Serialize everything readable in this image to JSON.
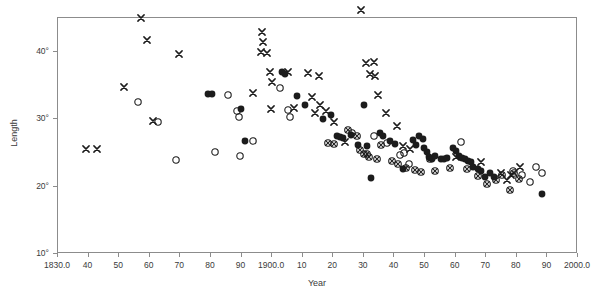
{
  "chart_data": {
    "type": "scatter",
    "title": "",
    "xlabel": "Year",
    "ylabel": "Length",
    "xlim": [
      1830.0,
      2000.0
    ],
    "ylim": [
      10,
      45
    ],
    "grid": false,
    "legend": "none",
    "x_ticks": [
      {
        "value": 1830,
        "label": "1830.0"
      },
      {
        "value": 1840,
        "label": "40"
      },
      {
        "value": 1850,
        "label": "50"
      },
      {
        "value": 1860,
        "label": "60"
      },
      {
        "value": 1870,
        "label": "70"
      },
      {
        "value": 1880,
        "label": "80"
      },
      {
        "value": 1890,
        "label": "90"
      },
      {
        "value": 1900,
        "label": "1900.0"
      },
      {
        "value": 1910,
        "label": "10"
      },
      {
        "value": 1920,
        "label": "20"
      },
      {
        "value": 1930,
        "label": "30"
      },
      {
        "value": 1940,
        "label": "40"
      },
      {
        "value": 1950,
        "label": "50"
      },
      {
        "value": 1960,
        "label": "60"
      },
      {
        "value": 1970,
        "label": "70"
      },
      {
        "value": 1980,
        "label": "80"
      },
      {
        "value": 1990,
        "label": "90"
      },
      {
        "value": 2000,
        "label": "2000.0"
      }
    ],
    "y_ticks": [
      {
        "value": 10,
        "label": "10°"
      },
      {
        "value": 20,
        "label": "20°"
      },
      {
        "value": 30,
        "label": "30°"
      },
      {
        "value": 40,
        "label": "40°"
      }
    ],
    "marker_types": [
      "cross",
      "open-circle",
      "filled-circle",
      "crossed-circle"
    ],
    "series": [
      {
        "name": "cross",
        "marker": "cross",
        "points": [
          [
            1839.5,
            25.4
          ],
          [
            1843.0,
            25.4
          ],
          [
            1852.0,
            34.6
          ],
          [
            1857.5,
            44.9
          ],
          [
            1859.5,
            41.6
          ],
          [
            1861.5,
            29.6
          ],
          [
            1870.0,
            39.5
          ],
          [
            1894.0,
            33.8
          ],
          [
            1897.0,
            42.8
          ],
          [
            1897.5,
            41.3
          ],
          [
            1896.8,
            39.8
          ],
          [
            1898.6,
            39.7
          ],
          [
            1899.5,
            36.9
          ],
          [
            1900.2,
            35.3
          ],
          [
            1900.0,
            31.3
          ],
          [
            1905.5,
            36.9
          ],
          [
            1907.5,
            31.5
          ],
          [
            1912.0,
            36.7
          ],
          [
            1913.5,
            33.2
          ],
          [
            1914.5,
            30.8
          ],
          [
            1915.5,
            36.3
          ],
          [
            1916.0,
            32.0
          ],
          [
            1918.0,
            31.1
          ],
          [
            1920.5,
            29.5
          ],
          [
            1924.0,
            26.4
          ],
          [
            1929.5,
            46.1
          ],
          [
            1931.0,
            38.2
          ],
          [
            1932.3,
            36.5
          ],
          [
            1933.5,
            38.4
          ],
          [
            1933.8,
            36.3
          ],
          [
            1935.0,
            33.5
          ],
          [
            1937.5,
            30.8
          ],
          [
            1941.0,
            28.8
          ],
          [
            1943.0,
            25.9
          ],
          [
            1945.5,
            25.4
          ],
          [
            1960.5,
            24.2
          ],
          [
            1968.5,
            23.5
          ],
          [
            1975.0,
            21.9
          ],
          [
            1977.0,
            20.8
          ],
          [
            1978.5,
            21.5
          ],
          [
            1981.5,
            22.8
          ]
        ]
      },
      {
        "name": "open-circle",
        "marker": "open-circle",
        "points": [
          [
            1856.5,
            32.4
          ],
          [
            1863.0,
            29.5
          ],
          [
            1869.0,
            23.8
          ],
          [
            1881.5,
            25.0
          ],
          [
            1886.0,
            33.5
          ],
          [
            1889.0,
            31.0
          ],
          [
            1889.5,
            30.1
          ],
          [
            1889.8,
            24.4
          ],
          [
            1894.0,
            26.6
          ],
          [
            1903.0,
            34.4
          ],
          [
            1905.5,
            31.2
          ],
          [
            1906.2,
            30.2
          ],
          [
            1926.5,
            27.8
          ],
          [
            1933.5,
            27.3
          ],
          [
            1938.0,
            26.3
          ],
          [
            1942.0,
            24.5
          ],
          [
            1943.5,
            24.9
          ],
          [
            1945.0,
            23.2
          ],
          [
            1962.0,
            26.4
          ],
          [
            1979.0,
            22.1
          ],
          [
            1982.0,
            21.5
          ],
          [
            1984.5,
            20.6
          ],
          [
            1986.5,
            22.7
          ],
          [
            1988.5,
            21.9
          ]
        ]
      },
      {
        "name": "filled-circle",
        "marker": "filled-circle",
        "points": [
          [
            1879.5,
            33.6
          ],
          [
            1880.8,
            33.6
          ],
          [
            1890.0,
            31.3
          ],
          [
            1891.5,
            26.6
          ],
          [
            1903.5,
            36.8
          ],
          [
            1904.5,
            36.6
          ],
          [
            1908.5,
            33.3
          ],
          [
            1911.0,
            31.9
          ],
          [
            1917.0,
            29.8
          ],
          [
            1919.5,
            30.4
          ],
          [
            1921.5,
            27.3
          ],
          [
            1922.5,
            27.2
          ],
          [
            1923.5,
            27.0
          ],
          [
            1926.0,
            27.5
          ],
          [
            1928.5,
            26.0
          ],
          [
            1930.5,
            32.0
          ],
          [
            1931.5,
            25.9
          ],
          [
            1932.5,
            21.1
          ],
          [
            1935.5,
            27.8
          ],
          [
            1936.5,
            27.3
          ],
          [
            1939.0,
            26.6
          ],
          [
            1940.5,
            26.1
          ],
          [
            1943.0,
            22.4
          ],
          [
            1946.5,
            26.8
          ],
          [
            1947.5,
            26.0
          ],
          [
            1948.5,
            27.3
          ],
          [
            1949.5,
            26.9
          ],
          [
            1950.0,
            25.5
          ],
          [
            1950.8,
            25.0
          ],
          [
            1951.5,
            24.3
          ],
          [
            1952.5,
            24.0
          ],
          [
            1953.5,
            24.4
          ],
          [
            1955.5,
            24.0
          ],
          [
            1956.5,
            24.0
          ],
          [
            1957.5,
            24.1
          ],
          [
            1959.5,
            25.5
          ],
          [
            1960.5,
            25.2
          ],
          [
            1961.5,
            24.4
          ],
          [
            1962.5,
            24.1
          ],
          [
            1963.5,
            23.9
          ],
          [
            1964.5,
            23.7
          ],
          [
            1965.5,
            23.5
          ],
          [
            1966.0,
            22.8
          ],
          [
            1967.5,
            22.4
          ],
          [
            1968.5,
            22.2
          ],
          [
            1970.0,
            21.2
          ],
          [
            1971.5,
            21.9
          ],
          [
            1973.0,
            21.2
          ],
          [
            1988.5,
            18.7
          ]
        ]
      },
      {
        "name": "crossed-circle",
        "marker": "crossed-circle",
        "points": [
          [
            1918.5,
            26.3
          ],
          [
            1920.5,
            26.2
          ],
          [
            1925.0,
            28.3
          ],
          [
            1928.0,
            27.4
          ],
          [
            1929.0,
            25.3
          ],
          [
            1930.5,
            24.7
          ],
          [
            1931.5,
            24.7
          ],
          [
            1932.0,
            24.3
          ],
          [
            1934.5,
            23.9
          ],
          [
            1936.0,
            26.0
          ],
          [
            1939.5,
            23.6
          ],
          [
            1941.5,
            23.2
          ],
          [
            1944.0,
            22.6
          ],
          [
            1947.0,
            22.3
          ],
          [
            1949.0,
            22.0
          ],
          [
            1952.0,
            24.0
          ],
          [
            1953.5,
            22.2
          ],
          [
            1958.5,
            22.6
          ],
          [
            1964.0,
            22.4
          ],
          [
            1967.5,
            21.4
          ],
          [
            1970.5,
            20.3
          ],
          [
            1973.5,
            20.9
          ],
          [
            1975.5,
            21.6
          ],
          [
            1978.0,
            19.4
          ],
          [
            1979.5,
            21.9
          ],
          [
            1981.0,
            21.0
          ]
        ]
      }
    ]
  }
}
